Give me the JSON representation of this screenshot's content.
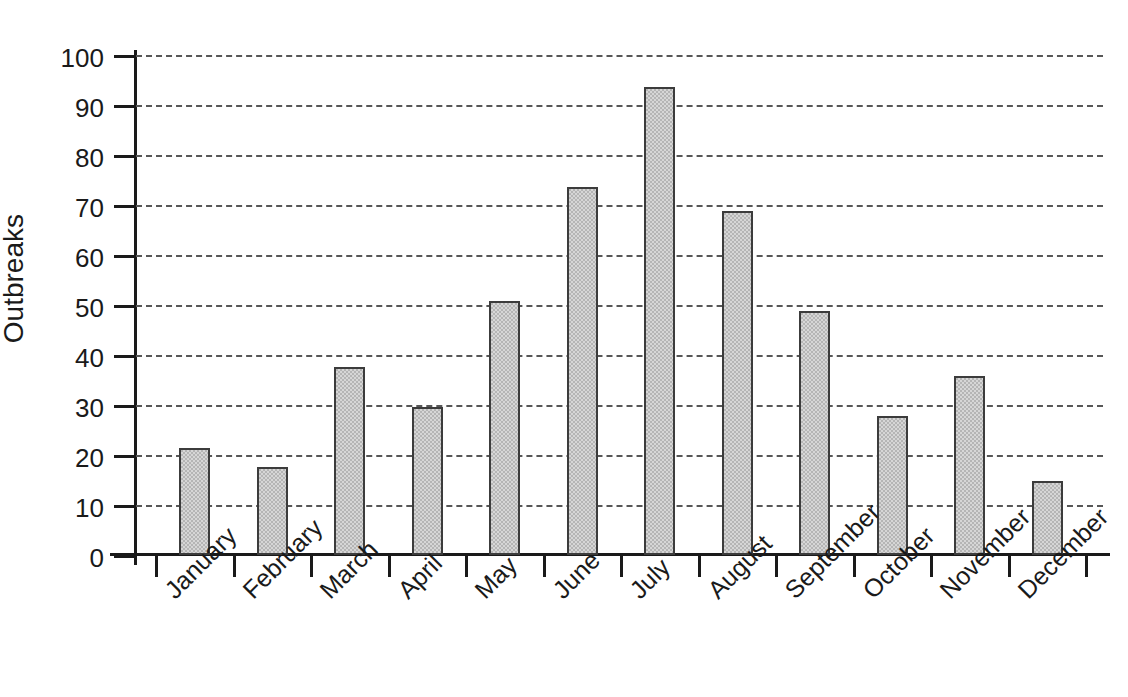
{
  "chart_data": {
    "type": "bar",
    "title": "",
    "subtitle": "",
    "xlabel": "",
    "ylabel": "Outbreaks",
    "ylim": [
      0,
      100
    ],
    "ytick_step": 10,
    "yticks": [
      0,
      10,
      20,
      30,
      40,
      50,
      60,
      70,
      80,
      90,
      100
    ],
    "ytick_labels": [
      "0",
      "10",
      "20",
      "30",
      "40",
      "50",
      "60",
      "70",
      "80",
      "90",
      "100"
    ],
    "grid": "horizontal-dashed",
    "legend": "none",
    "categories": [
      "January",
      "February",
      "March",
      "April",
      "May",
      "June",
      "July",
      "August",
      "September",
      "October",
      "November",
      "December"
    ],
    "values": [
      21.5,
      17.7,
      37.6,
      29.7,
      50.8,
      73.6,
      93.7,
      68.8,
      48.9,
      27.8,
      35.9,
      14.8
    ],
    "bar_color": "#b5b5b5",
    "bar_edge_color": "#3c3c3c",
    "gridline_color": "#575757",
    "axis_color": "#1a1a1a",
    "background_color": "#ffffff",
    "xtick_label_rotation": -45
  }
}
